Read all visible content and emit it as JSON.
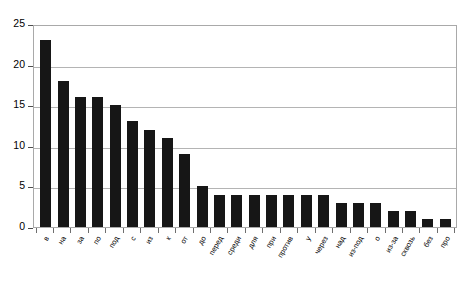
{
  "chart_data": {
    "type": "bar",
    "title": "",
    "subtitle": "",
    "xlabel": "",
    "ylabel": "",
    "ylim": [
      0,
      25
    ],
    "ytick_values": [
      0,
      5,
      10,
      15,
      20,
      25
    ],
    "ytick_labels": [
      "0",
      "5",
      "10",
      "15",
      "20",
      "25"
    ],
    "grid": true,
    "grid_axis": "y",
    "legend": false,
    "legend_position": "none",
    "bar_color": "#161616",
    "plot_border_color": "#a9a9a9",
    "gridline_color": "#b4b4b4",
    "background_color": "#ffffff",
    "categories": [
      "в",
      "на",
      "за",
      "по",
      "под",
      "с",
      "из",
      "к",
      "от",
      "до",
      "перед",
      "среди",
      "для",
      "при",
      "против",
      "у",
      "через",
      "над",
      "из-под",
      "о",
      "из-за",
      "сквозь",
      "без",
      "про"
    ],
    "values": [
      23,
      18,
      16,
      16,
      15,
      13,
      12,
      11,
      9,
      5,
      4,
      4,
      4,
      4,
      4,
      4,
      4,
      3,
      3,
      3,
      2,
      2,
      1,
      1
    ],
    "series": [
      {
        "name": "",
        "values": [
          23,
          18,
          16,
          16,
          15,
          13,
          12,
          11,
          9,
          5,
          4,
          4,
          4,
          4,
          4,
          4,
          4,
          3,
          3,
          3,
          2,
          2,
          1,
          1
        ]
      }
    ]
  }
}
